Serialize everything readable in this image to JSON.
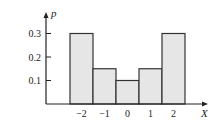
{
  "chart_data": {
    "type": "bar",
    "title": "",
    "xlabel": "X",
    "ylabel": "p",
    "categories": [
      "−2",
      "−1",
      "0",
      "1",
      "2"
    ],
    "x": [
      -2,
      -1,
      0,
      1,
      2
    ],
    "values": [
      0.3,
      0.15,
      0.1,
      0.15,
      0.3
    ],
    "yticks": [
      "0.1",
      "0.2",
      "0.3"
    ],
    "ytick_values": [
      0.1,
      0.2,
      0.3
    ],
    "ylim": [
      0,
      0.35
    ],
    "grid": false,
    "legend": "none",
    "colors": {
      "bar_fill": "#e6e6e6",
      "bar_stroke": "#333333",
      "axis": "#222222"
    }
  }
}
